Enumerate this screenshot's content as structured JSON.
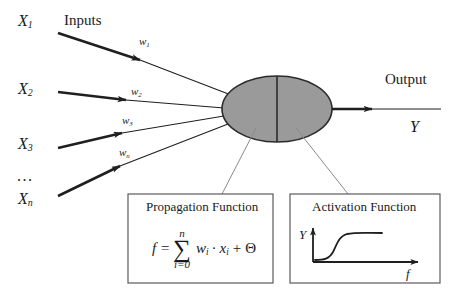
{
  "diagram": {
    "inputs_heading": "Inputs",
    "output_heading": "Output",
    "output_symbol": "Y",
    "ellipsis": "...",
    "input_nodes": [
      {
        "base": "X",
        "sub": "1"
      },
      {
        "base": "X",
        "sub": "2"
      },
      {
        "base": "X",
        "sub": "3"
      },
      {
        "base": "X",
        "sub": "n"
      }
    ],
    "weights": [
      {
        "base": "w",
        "sub": "1"
      },
      {
        "base": "w",
        "sub": "2"
      },
      {
        "base": "w",
        "sub": "3"
      },
      {
        "base": "w",
        "sub": "n"
      }
    ],
    "neuron": {
      "fill_color": "#9a9a9a",
      "stroke_color": "#2b2b2b"
    },
    "propagation_box": {
      "title": "Propagation Function",
      "formula": {
        "lhs": "f =",
        "sigma": "∑",
        "upper_limit": "n",
        "lower_limit": "i=0",
        "body_w": "w",
        "body_w_sub": "i",
        "dot": "·",
        "body_x": "x",
        "body_x_sub": "i",
        "plus": "+",
        "theta": "Θ"
      }
    },
    "activation_box": {
      "title": "Activation Function",
      "y_axis_label": "Y",
      "x_axis_label": "f",
      "curve": "sigmoid"
    },
    "line_color": "#1f1f1f",
    "leader_color": "#7a7a7a"
  }
}
